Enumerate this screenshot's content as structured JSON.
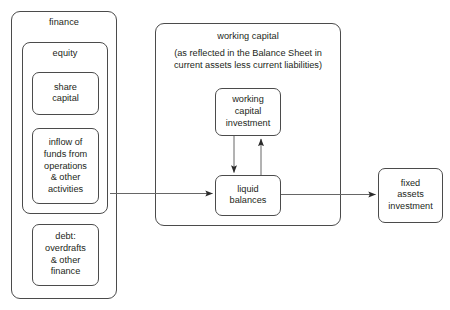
{
  "diagram": {
    "title_hidden": "",
    "finance": {
      "label": "finance",
      "equity": {
        "label": "equity",
        "share_capital": {
          "label": "share\ncapital"
        },
        "inflow": {
          "label": "inflow of\nfunds from\noperations\n& other\nactivities"
        }
      },
      "debt": {
        "label": "debt:\noverdrafts\n& other\nfinance"
      }
    },
    "working_capital": {
      "label": "working capital",
      "subtitle": "(as reflected in the Balance Sheet in current assets less current liabilities)",
      "investment": {
        "label": "working\ncapital\ninvestment"
      },
      "liquid_balances": {
        "label": "liquid\nbalances"
      }
    },
    "fixed_assets": {
      "label": "fixed\nassets\ninvestment"
    },
    "arrows": [
      {
        "name": "finance-to-liquid-balances",
        "from": "finance",
        "to": "liquid balances"
      },
      {
        "name": "wc-investment-to-liquid-balances",
        "from": "working capital investment",
        "to": "liquid balances"
      },
      {
        "name": "liquid-balances-to-wc-investment",
        "from": "liquid balances",
        "to": "working capital investment"
      },
      {
        "name": "liquid-balances-to-fixed-assets",
        "from": "liquid balances",
        "to": "fixed assets investment"
      }
    ],
    "colors": {
      "stroke": "#4b4b4b",
      "text": "#231f20",
      "arrow": "#555555",
      "background": "#ffffff"
    }
  }
}
